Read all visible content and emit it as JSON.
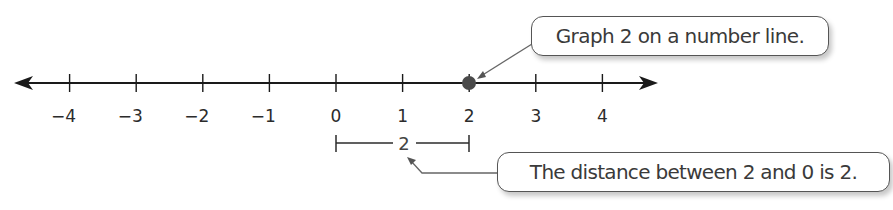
{
  "chart_data": {
    "type": "number_line",
    "title": "",
    "axis": {
      "min": -4,
      "max": 4,
      "tick_labels": [
        "−4",
        "−3",
        "−2",
        "−1",
        "0",
        "1",
        "2",
        "3",
        "4"
      ],
      "tick_values": [
        -4,
        -3,
        -2,
        -1,
        0,
        1,
        2,
        3,
        4
      ],
      "arrows_both_ends": true
    },
    "points": [
      {
        "value": 2,
        "style": "closed-dot",
        "color": "#4a4a4a"
      }
    ],
    "distance_bracket": {
      "from": 0,
      "to": 2,
      "label": "2"
    },
    "annotations": [
      {
        "text": "Graph 2 on a number line.",
        "points_to": "point at 2"
      },
      {
        "text": "The distance between 2 and 0 is 2.",
        "points_to": "distance bracket label"
      }
    ]
  },
  "callouts": {
    "graph": "Graph 2 on a number line.",
    "distance": "The distance between 2 and 0 is 2."
  },
  "bracket_label": "2",
  "colors": {
    "line": "#1a1a1a",
    "dot": "#4a4a4a",
    "leader": "#666666",
    "text": "#2b2b2b"
  }
}
